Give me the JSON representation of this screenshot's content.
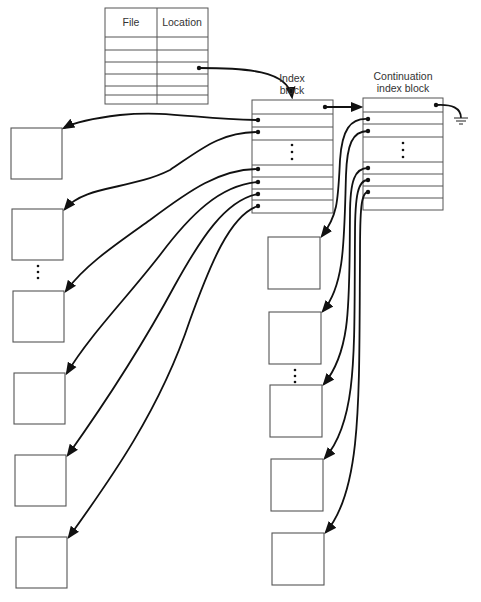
{
  "diagram": {
    "type": "indexed-file-allocation",
    "directory_table": {
      "headers": [
        "File",
        "Location"
      ],
      "row_count": 6,
      "pointer_row": 2
    },
    "index_block": {
      "label_line1": "Index",
      "label_line2": "block",
      "entries_top": 2,
      "ellipsis": "⋮",
      "entries_bottom": 4,
      "link_to_continuation": true
    },
    "continuation_index_block": {
      "label_line1": "Continuation",
      "label_line2": "index block",
      "entries_top": 2,
      "ellipsis": "⋮",
      "entries_bottom": 3,
      "terminator": "ground-symbol (null pointer)"
    },
    "data_blocks_left": {
      "count": 6,
      "ellipsis_after": 2
    },
    "data_blocks_right": {
      "count": 5,
      "ellipsis_after": 2
    },
    "colors": {
      "line": "#111111",
      "box_border": "#555555",
      "text": "#333333",
      "background": "#ffffff"
    }
  }
}
